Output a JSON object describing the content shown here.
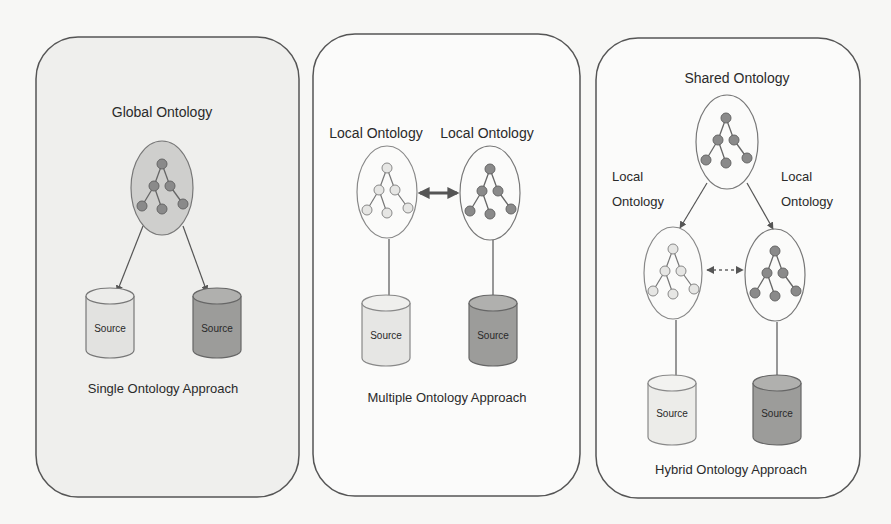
{
  "diagram": {
    "colors": {
      "panel_fill_single": "#efefed",
      "panel_fill": "#fbfbfa",
      "panel_stroke": "#555555",
      "global_fill": "#cfcfcd",
      "node_dark": "#8a8a8a",
      "node_light": "#e6e6e4",
      "source_light": "#e2e2e0",
      "source_dark": "#9c9c9a",
      "edge": "#666666"
    },
    "panels": [
      {
        "id": "single",
        "ontology_labels": [
          "Global Ontology"
        ],
        "sources": [
          "Source",
          "Source"
        ],
        "caption": "Single Ontology Approach"
      },
      {
        "id": "multiple",
        "ontology_labels": [
          "Local Ontology",
          "Local Ontology"
        ],
        "sources": [
          "Source",
          "Source"
        ],
        "caption": "Multiple Ontology Approach"
      },
      {
        "id": "hybrid",
        "ontology_labels": [
          "Shared Ontology",
          "Local",
          "Ontology",
          "Local",
          "Ontology"
        ],
        "sources": [
          "Source",
          "Source"
        ],
        "caption": "Hybrid Ontology Approach"
      }
    ]
  }
}
